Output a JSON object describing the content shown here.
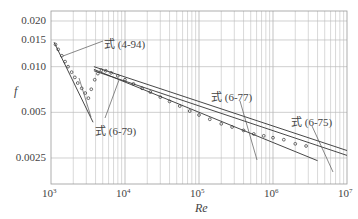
{
  "chart_data": {
    "type": "line",
    "title": "",
    "xlabel": "Re",
    "ylabel": "f",
    "xscale": "log",
    "yscale": "log",
    "xlim": [
      1000,
      10000000
    ],
    "ylim": [
      0.0019,
      0.022
    ],
    "grid": true,
    "x_ticks": [
      {
        "sup": "3",
        "base": "10",
        "value": 1000
      },
      {
        "sup": "4",
        "base": "10",
        "value": 10000
      },
      {
        "sup": "5",
        "base": "10",
        "value": 100000
      },
      {
        "sup": "6",
        "base": "10",
        "value": 1000000
      },
      {
        "sup": "7",
        "base": "10",
        "value": 10000000
      }
    ],
    "y_ticks": [
      "0.020",
      "0.015",
      "0.010",
      "0.005",
      "0.0025"
    ],
    "y_tick_values": [
      0.02,
      0.015,
      0.01,
      0.005,
      0.0025
    ],
    "annotations": [
      {
        "label": "式（4-94）",
        "text": "式 (4-94)"
      },
      {
        "label": "式（6-79）",
        "text": "式 (6-79)"
      },
      {
        "label": "式（6-77）",
        "text": "式 (6-77)"
      },
      {
        "label": "式（6-75）",
        "text": "式 (6-75)"
      }
    ],
    "series": [
      {
        "name": "式 (4-94) laminar",
        "x": [
          1100,
          3700
        ],
        "y": [
          0.0145,
          0.0043
        ]
      },
      {
        "name": "式 (6-79)",
        "x": [
          3800,
          4000000
        ],
        "y": [
          0.0096,
          0.0024
        ]
      },
      {
        "name": "式 (6-77)",
        "x": [
          3800,
          10000000
        ],
        "y": [
          0.01,
          0.0028
        ]
      },
      {
        "name": "式 (6-75)",
        "x": [
          3800,
          10000000
        ],
        "y": [
          0.0094,
          0.0026
        ]
      },
      {
        "name": "experimental data",
        "type": "scatter",
        "x": [
          1150,
          1250,
          1400,
          1550,
          1700,
          1900,
          2100,
          2300,
          2600,
          2900,
          3200,
          3500,
          3900,
          4300,
          4800,
          5500,
          6500,
          8000,
          10000,
          13000,
          17000,
          22000,
          30000,
          40000,
          55000,
          75000,
          100000,
          140000,
          200000,
          280000,
          400000,
          550000,
          750000,
          1000000,
          1400000,
          2000000,
          2800000
        ],
        "y": [
          0.014,
          0.013,
          0.0118,
          0.0108,
          0.01,
          0.0092,
          0.0085,
          0.0078,
          0.0072,
          0.0067,
          0.0062,
          0.0071,
          0.0082,
          0.009,
          0.0095,
          0.0094,
          0.0091,
          0.0087,
          0.0082,
          0.0077,
          0.0072,
          0.0068,
          0.0063,
          0.0059,
          0.0055,
          0.0051,
          0.0048,
          0.0045,
          0.0042,
          0.004,
          0.0038,
          0.0036,
          0.0035,
          0.0034,
          0.0033,
          0.0031,
          0.003
        ]
      }
    ]
  }
}
